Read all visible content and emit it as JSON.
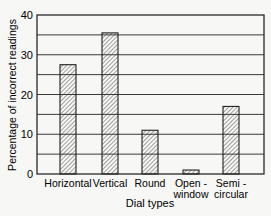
{
  "chart_data": {
    "type": "bar",
    "title": "",
    "xlabel": "Dial types",
    "ylabel": "Percentage of incorrect readings",
    "categories": [
      [
        "Horizontal"
      ],
      [
        "Vertical"
      ],
      [
        "Round"
      ],
      [
        "Open -",
        "window"
      ],
      [
        "Semi -",
        "circular"
      ]
    ],
    "category_names": [
      "Horizontal",
      "Vertical",
      "Round",
      "Open-window",
      "Semi-circular"
    ],
    "values": [
      27.5,
      35.5,
      11,
      1,
      17
    ],
    "ylim": [
      0,
      40
    ],
    "yticks": [
      0,
      10,
      20,
      30,
      40
    ],
    "grid": "horizontal every 5",
    "legend": null,
    "bar_fill": "diagonal hatch"
  },
  "colors": {
    "line": "#2a2a2a",
    "background": "#f7f7f5"
  }
}
